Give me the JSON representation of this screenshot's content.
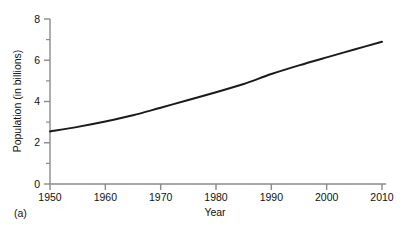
{
  "chart_data": {
    "type": "line",
    "title": "",
    "subtitle": "",
    "xlabel": "Year",
    "ylabel": "Population (in billions)",
    "panel_label": "(a)",
    "xlim": [
      1950,
      2010
    ],
    "ylim": [
      0,
      8
    ],
    "xticks": [
      1950,
      1960,
      1970,
      1980,
      1990,
      2000,
      2010
    ],
    "xtick_labels": [
      "1950",
      "1960",
      "1970",
      "1980",
      "1990",
      "2000",
      "2010"
    ],
    "yticks": [
      0,
      2,
      4,
      6,
      8
    ],
    "ytick_labels": [
      "0",
      "2",
      "4",
      "6",
      "8"
    ],
    "yminor_ticks": [
      1,
      3,
      5,
      7
    ],
    "grid": false,
    "legend": null,
    "legend_position": "none",
    "line_color": "#1a1a1a",
    "line_width": 2.0,
    "axis_color": "#888888",
    "series": [
      {
        "name": "World population",
        "x": [
          1950,
          1955,
          1960,
          1965,
          1970,
          1975,
          1980,
          1985,
          1990,
          1995,
          2000,
          2005,
          2010
        ],
        "values": [
          2.55,
          2.77,
          3.03,
          3.33,
          3.7,
          4.07,
          4.45,
          4.85,
          5.33,
          5.75,
          6.14,
          6.52,
          6.9
        ]
      }
    ]
  },
  "axis": {
    "y_title": "Population (in billions)",
    "x_title": "Year",
    "panel": "(a)"
  }
}
